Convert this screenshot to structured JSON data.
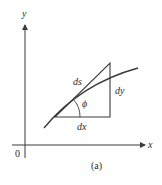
{
  "figure": {
    "caption": "(a)",
    "axes": {
      "x_label": "x",
      "y_label": "y",
      "origin_label": "0"
    },
    "labels": {
      "ds": "ds",
      "dx": "dx",
      "dy": "dy",
      "phi": "ϕ"
    },
    "colors": {
      "line": "#3a3a3a",
      "background": "#ffffff"
    }
  }
}
